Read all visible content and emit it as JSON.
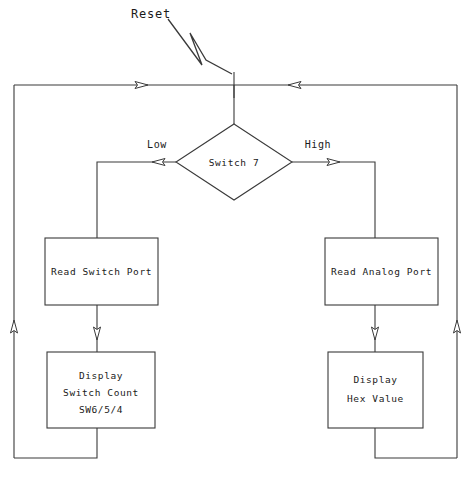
{
  "diagram": {
    "type": "flowchart",
    "entry": {
      "label": "Reset",
      "icon": "lightning-bolt-pointer"
    },
    "decision": {
      "label": "Switch 7",
      "branch_left_label": "Low",
      "branch_right_label": "High"
    },
    "left_branch": {
      "process": {
        "label": "Read Switch Port"
      },
      "display": {
        "line1": "Display",
        "line2": "Switch Count",
        "line3": "SW6/5/4"
      }
    },
    "right_branch": {
      "process": {
        "label": "Read Analog Port"
      },
      "display": {
        "line1": "Display",
        "line2": "Hex Value"
      }
    },
    "colors": {
      "stroke": "#3a3a3a",
      "fill": "#ffffff",
      "text": "#1a1a1a",
      "background": "#ffffff"
    }
  }
}
